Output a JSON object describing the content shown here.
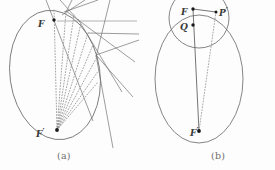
{
  "figure": {
    "background_color": "#fdfdfd",
    "stroke_color": "#6f6f6f",
    "dot_color": "#1a1a1a",
    "label_color": "#3a3a3a",
    "caption_color": "#6e6e6e",
    "width": 275,
    "height": 170
  },
  "panels": [
    {
      "id": "a",
      "caption": "(a)",
      "labels": {
        "focus_upper": {
          "base": "F",
          "prime": ""
        },
        "focus_lower": {
          "base": "F",
          "prime": "′"
        }
      },
      "ellipse": {
        "cx": 55,
        "cy": 75,
        "rx": 45,
        "ry": 65,
        "rotation": -8
      },
      "points": [
        {
          "name": "F",
          "x": 54,
          "y": 20
        },
        {
          "name": "F'",
          "x": 57,
          "y": 130
        }
      ],
      "dotted_rays": [
        {
          "x1": 57,
          "y1": 130,
          "x2": 54,
          "y2": 9
        },
        {
          "x1": 57,
          "y1": 130,
          "x2": 66,
          "y2": 11
        },
        {
          "x1": 57,
          "y1": 130,
          "x2": 74,
          "y2": 15
        },
        {
          "x1": 57,
          "y1": 130,
          "x2": 81,
          "y2": 23
        },
        {
          "x1": 57,
          "y1": 130,
          "x2": 88,
          "y2": 33
        },
        {
          "x1": 57,
          "y1": 130,
          "x2": 93,
          "y2": 45
        },
        {
          "x1": 57,
          "y1": 130,
          "x2": 97,
          "y2": 57
        },
        {
          "x1": 57,
          "y1": 130,
          "x2": 99,
          "y2": 70
        },
        {
          "x1": 57,
          "y1": 130,
          "x2": 98,
          "y2": 82
        }
      ],
      "tangent_lines": [
        {
          "x1": 46,
          "y1": 0,
          "x2": 93,
          "y2": 121
        },
        {
          "x1": 60,
          "y1": 0,
          "x2": 78,
          "y2": 20
        },
        {
          "x1": 72,
          "y1": 0,
          "x2": 66,
          "y2": 12
        },
        {
          "x1": 85,
          "y1": 0,
          "x2": 62,
          "y2": 15
        },
        {
          "x1": 98,
          "y1": 0,
          "x2": 64,
          "y2": 12
        },
        {
          "x1": 57,
          "y1": 21,
          "x2": 137,
          "y2": 21
        },
        {
          "x1": 66,
          "y1": 11,
          "x2": 135,
          "y2": 62
        },
        {
          "x1": 78,
          "y1": 19,
          "x2": 122,
          "y2": 92
        },
        {
          "x1": 88,
          "y1": 33,
          "x2": 139,
          "y2": 34
        },
        {
          "x1": 96,
          "y1": 55,
          "x2": 138,
          "y2": 40
        },
        {
          "x1": 96,
          "y1": 55,
          "x2": 133,
          "y2": 97
        },
        {
          "x1": 96,
          "y1": 55,
          "x2": 113,
          "y2": 148
        },
        {
          "x1": 110,
          "y1": 0,
          "x2": 96,
          "y2": 57
        }
      ]
    },
    {
      "id": "b",
      "caption": "(b)",
      "labels": {
        "focus_upper": {
          "base": "F",
          "prime": ""
        },
        "point_q": {
          "base": "Q",
          "prime": ""
        },
        "point_p": {
          "base": "P",
          "prime": "′"
        },
        "focus_lower": {
          "base": "F",
          "prime": "′"
        }
      },
      "ellipse": {
        "cx": 199,
        "cy": 79,
        "rx": 44,
        "ry": 64,
        "rotation": 0
      },
      "circle": {
        "cx": 199,
        "cy": 18,
        "r": 30
      },
      "points": [
        {
          "name": "F",
          "x": 193,
          "y": 9
        },
        {
          "name": "Q",
          "x": 193,
          "y": 25
        },
        {
          "name": "P",
          "x": 216,
          "y": 12
        },
        {
          "name": "F'",
          "x": 199,
          "y": 131
        }
      ],
      "solid_segments": [
        {
          "x1": 193,
          "y1": 9,
          "x2": 216,
          "y2": 12
        },
        {
          "x1": 193,
          "y1": 9,
          "x2": 199,
          "y2": 131
        }
      ],
      "dotted_segments": [
        {
          "x1": 216,
          "y1": 12,
          "x2": 199,
          "y2": 131
        }
      ]
    }
  ]
}
